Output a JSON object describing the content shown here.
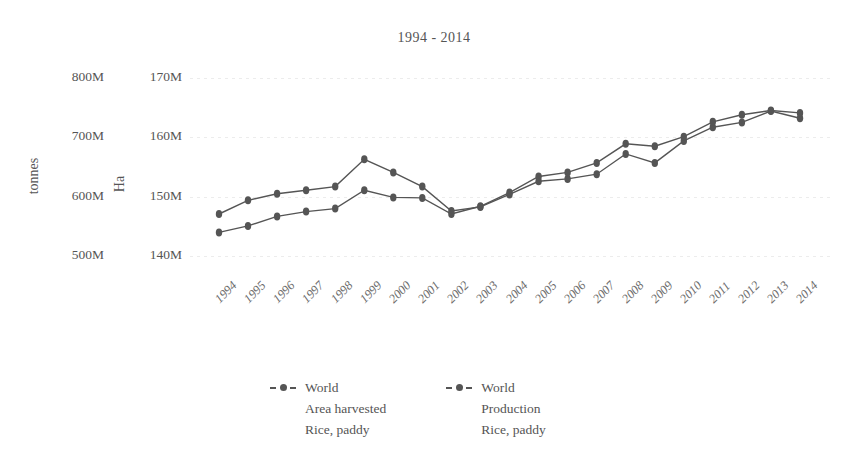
{
  "chart_data": {
    "type": "line",
    "title": "1994 - 2014",
    "xlabel": "",
    "ylabel": "tonnes",
    "ylabel_secondary": "Ha",
    "grid": true,
    "legend_position": "bottom",
    "categories": [
      "1994",
      "1995",
      "1996",
      "1997",
      "1998",
      "1999",
      "2000",
      "2001",
      "2002",
      "2003",
      "2004",
      "2005",
      "2006",
      "2007",
      "2008",
      "2009",
      "2010",
      "2011",
      "2012",
      "2013",
      "2014"
    ],
    "axes": {
      "left": {
        "label": "tonnes",
        "ticks": [
          "500M",
          "600M",
          "700M",
          "800M"
        ],
        "tick_values": [
          500000000,
          600000000,
          700000000,
          800000000
        ],
        "ylim": [
          460000000,
          830000000
        ]
      },
      "right": {
        "label": "Ha",
        "ticks": [
          "140M",
          "150M",
          "160M",
          "170M"
        ],
        "tick_values": [
          140000000,
          150000000,
          160000000,
          170000000
        ],
        "ylim": [
          136000000,
          173000000
        ]
      }
    },
    "series": [
      {
        "name": "World Area harvested Rice, paddy",
        "axis": "right",
        "unit": "Ha",
        "color": "#555555",
        "values": [
          147100000,
          149400000,
          150500000,
          151100000,
          151700000,
          156300000,
          154100000,
          151700000,
          147600000,
          148300000,
          150400000,
          152600000,
          153000000,
          153800000,
          157200000,
          155700000,
          159400000,
          161700000,
          162500000,
          164400000,
          163200000
        ]
      },
      {
        "name": "World Production Rice, paddy",
        "axis": "left",
        "unit": "tonnes",
        "color": "#555555",
        "values": [
          540000000,
          551000000,
          567000000,
          575000000,
          580000000,
          611000000,
          599000000,
          598000000,
          571000000,
          584000000,
          607000000,
          634000000,
          641000000,
          657000000,
          689000000,
          685000000,
          701000000,
          726000000,
          738000000,
          745000000,
          741000000
        ]
      }
    ]
  },
  "legend": {
    "entries": [
      {
        "line1": "World",
        "line2": "Area harvested",
        "line3": "Rice, paddy"
      },
      {
        "line1": "World",
        "line2": "Production",
        "line3": "Rice, paddy"
      }
    ]
  }
}
